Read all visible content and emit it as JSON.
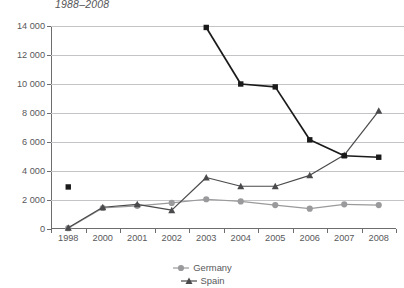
{
  "chart_data": {
    "type": "line",
    "title": "1988–2008",
    "xlabel": "",
    "ylabel": "",
    "ylim": [
      0,
      14000
    ],
    "ytick_step": 2000,
    "ytick_labels": [
      "0",
      "2 000",
      "4 000",
      "6 000",
      "8 000",
      "10 000",
      "12 000",
      "14 000"
    ],
    "ytick_values": [
      0,
      2000,
      4000,
      6000,
      8000,
      10000,
      12000,
      14000
    ],
    "categories": [
      "1998",
      "2000",
      "2001",
      "2002",
      "2003",
      "2004",
      "2005",
      "2006",
      "2007",
      "2008"
    ],
    "grid": "horizontal",
    "legend_position": "bottom-center",
    "series": [
      {
        "name": "Unlabelled (black squares)",
        "marker": "square",
        "color": "#1a1a1a",
        "values": [
          2900,
          null,
          null,
          null,
          13900,
          10000,
          9800,
          6150,
          5050,
          4950
        ]
      },
      {
        "name": "Spain",
        "marker": "triangle",
        "color": "#4a4a4c",
        "values": [
          80,
          1500,
          1700,
          1300,
          3550,
          2950,
          2950,
          3700,
          5100,
          8150
        ]
      },
      {
        "name": "Germany",
        "marker": "circle",
        "color": "#9a9a9c",
        "values": [
          60,
          1450,
          1600,
          1800,
          2050,
          1900,
          1650,
          1400,
          1700,
          1650
        ]
      }
    ]
  },
  "legend": {
    "entries": [
      {
        "label": "Germany",
        "marker": "circle",
        "color": "#9a9a9c"
      },
      {
        "label": "Spain",
        "marker": "triangle",
        "color": "#4a4a4c"
      }
    ]
  },
  "colors": {
    "axis": "#6d6d70",
    "grid": "#c4c4c6",
    "text": "#58585a",
    "series_black": "#1a1a1a",
    "series_spain": "#4a4a4c",
    "series_germany": "#9a9a9c",
    "background": "#ffffff"
  }
}
